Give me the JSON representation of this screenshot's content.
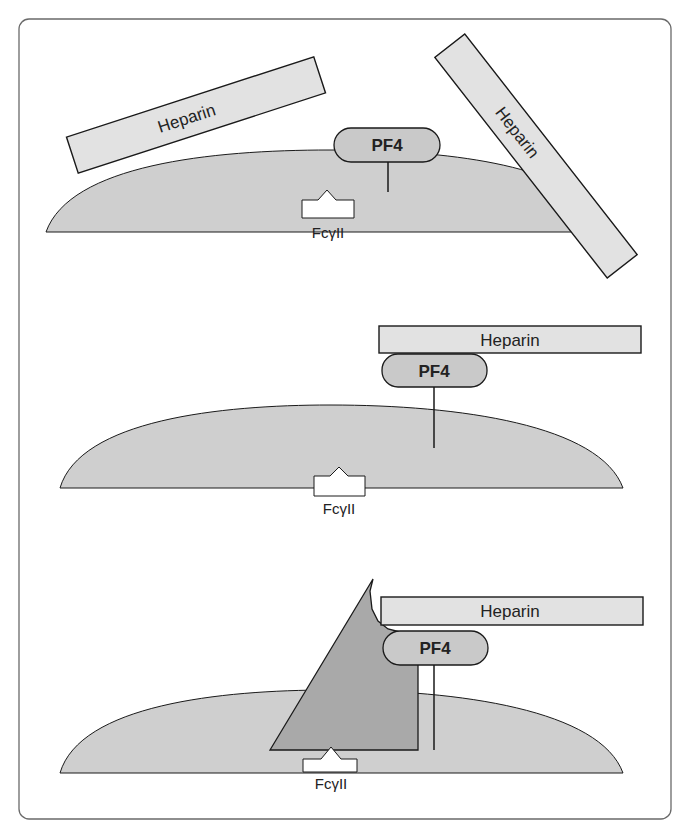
{
  "figure": {
    "colors": {
      "frame": "#6a6a6a",
      "cell_fill": "#cfcfcf",
      "heparin_fill": "#e2e2e2",
      "pf4_fill": "#c9c9c9",
      "antibody_fill": "#a9a9a9",
      "receptor_fill": "#ffffff",
      "stroke": "#1a1a1a"
    },
    "panels": [
      {
        "id": "panel-1",
        "description": "Unbound heparin and PF4 near platelet surface",
        "heparin_labels": [
          "Heparin",
          "Heparin"
        ],
        "pf4_label": "PF4",
        "receptor_label": "FcγII"
      },
      {
        "id": "panel-2",
        "description": "Heparin bound to PF4 on platelet surface",
        "heparin_label": "Heparin",
        "pf4_label": "PF4",
        "receptor_label": "FcγII"
      },
      {
        "id": "panel-3",
        "description": "Antibody binds heparin-PF4 complex and FcγII receptor",
        "heparin_label": "Heparin",
        "pf4_label": "PF4",
        "receptor_label": "FcγII"
      }
    ]
  }
}
